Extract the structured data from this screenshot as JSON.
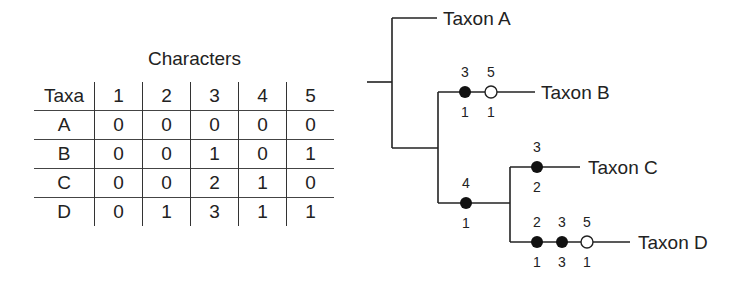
{
  "table": {
    "caption": "Characters",
    "header": [
      "Taxa",
      "1",
      "2",
      "3",
      "4",
      "5"
    ],
    "rows": [
      [
        "A",
        "0",
        "0",
        "0",
        "0",
        "0"
      ],
      [
        "B",
        "0",
        "0",
        "1",
        "0",
        "1"
      ],
      [
        "C",
        "0",
        "0",
        "2",
        "1",
        "0"
      ],
      [
        "D",
        "0",
        "1",
        "3",
        "1",
        "1"
      ]
    ]
  },
  "tree": {
    "taxa": [
      "Taxon A",
      "Taxon B",
      "Taxon C",
      "Taxon D"
    ],
    "changes": [
      {
        "branch": "B",
        "character": "3",
        "state": "1",
        "type": "filled"
      },
      {
        "branch": "B",
        "character": "5",
        "state": "1",
        "type": "open"
      },
      {
        "branch": "CD",
        "character": "4",
        "state": "1",
        "type": "filled"
      },
      {
        "branch": "C",
        "character": "3",
        "state": "2",
        "type": "filled"
      },
      {
        "branch": "D",
        "character": "2",
        "state": "1",
        "type": "filled"
      },
      {
        "branch": "D",
        "character": "3",
        "state": "3",
        "type": "filled"
      },
      {
        "branch": "D",
        "character": "5",
        "state": "1",
        "type": "open"
      }
    ]
  }
}
